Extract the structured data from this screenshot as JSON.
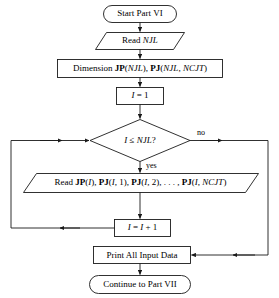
{
  "diagram": {
    "line_color": "#1a1a1a",
    "text_color": "#000000",
    "background": "#ffffff",
    "nodes": [
      {
        "id": "start",
        "name": "start-terminator",
        "shape": "terminator",
        "text": "Start Part VI",
        "x": 103,
        "y": 5,
        "w": 74,
        "h": 18,
        "font_size": 9
      },
      {
        "id": "read_njl",
        "name": "read-njl-io",
        "shape": "parallelogram",
        "text": "Read NJL",
        "x": 96,
        "y": 32,
        "w": 88,
        "h": 18,
        "font_size": 9
      },
      {
        "id": "dimension",
        "name": "dimension-process",
        "shape": "process",
        "text": "Dimension JP(NJL), PJ(NJL, NCJT)",
        "x": 57,
        "y": 59,
        "w": 166,
        "h": 19,
        "font_size": 9
      },
      {
        "id": "init_i",
        "name": "initialize-i-process",
        "shape": "process",
        "text": "I = 1",
        "x": 116,
        "y": 87,
        "w": 48,
        "h": 18,
        "font_size": 9
      },
      {
        "id": "decision",
        "name": "loop-condition-decision",
        "shape": "decision",
        "text": "I ≤ NJL?",
        "x": 90,
        "y": 119,
        "w": 100,
        "h": 43,
        "font_size": 9
      },
      {
        "id": "read_loop",
        "name": "read-joint-data-io",
        "shape": "parallelogram",
        "text": "Read JP(I), PJ(I, 1), PJ(I, 2), . . . , PJ(I, NCJT)",
        "x": 23,
        "y": 173,
        "w": 235,
        "h": 20,
        "font_size": 9
      },
      {
        "id": "incr_i",
        "name": "increment-i-process",
        "shape": "process",
        "text": "I = I + 1",
        "x": 114,
        "y": 219,
        "w": 57,
        "h": 18,
        "font_size": 9
      },
      {
        "id": "print",
        "name": "print-input-data-process",
        "shape": "process",
        "text": "Print All Input Data",
        "x": 93,
        "y": 246,
        "w": 98,
        "h": 18,
        "font_size": 9
      },
      {
        "id": "continue",
        "name": "continue-terminator",
        "shape": "terminator",
        "text": "Continue to Part VII",
        "x": 89,
        "y": 275,
        "w": 102,
        "h": 19,
        "font_size": 9
      }
    ],
    "edge_labels": [
      {
        "id": "no",
        "name": "no-branch-label",
        "text": "no",
        "x": 197,
        "y": 129
      },
      {
        "id": "yes",
        "name": "yes-branch-label",
        "text": "yes",
        "x": 146,
        "y": 163
      }
    ],
    "edges": [
      {
        "id": "start-to-read",
        "name": "edge-start-to-read-njl",
        "from": "start",
        "to": "read_njl"
      },
      {
        "id": "read-to-dim",
        "name": "edge-read-njl-to-dimension",
        "from": "read_njl",
        "to": "dimension"
      },
      {
        "id": "dim-to-init",
        "name": "edge-dimension-to-init",
        "from": "dimension",
        "to": "init_i"
      },
      {
        "id": "init-to-decision",
        "name": "edge-init-to-decision",
        "from": "init_i",
        "to": "decision"
      },
      {
        "id": "decision-yes",
        "name": "edge-decision-yes-to-read",
        "from": "decision",
        "to": "read_loop",
        "label": "yes"
      },
      {
        "id": "read-to-incr",
        "name": "edge-read-to-increment",
        "from": "read_loop",
        "to": "incr_i"
      },
      {
        "id": "incr-loopback",
        "name": "edge-increment-loopback-to-decision",
        "from": "incr_i",
        "to": "decision"
      },
      {
        "id": "decision-no",
        "name": "edge-decision-no-to-print",
        "from": "decision",
        "to": "print",
        "label": "no"
      },
      {
        "id": "print-to-continue",
        "name": "edge-print-to-continue",
        "from": "print",
        "to": "continue"
      }
    ]
  }
}
